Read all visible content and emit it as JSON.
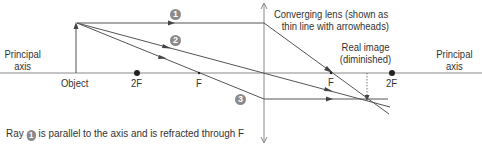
{
  "labels": {
    "principal_axis_left": [
      "Principal",
      "axis"
    ],
    "principal_axis_right": [
      "Principal",
      "axis"
    ],
    "object": "Object",
    "left_2f": "2F",
    "left_f": "F",
    "right_f": "F",
    "right_2f": "2F",
    "lens": [
      "Converging lens (shown as",
      "thin line with arrowheads)"
    ],
    "image": [
      "Real image",
      "(diminished)"
    ]
  },
  "rays": [
    {
      "number": "1",
      "description": "parallel to axis, refracted through F"
    },
    {
      "number": "2",
      "description": "through optical centre, undeviated"
    },
    {
      "number": "3",
      "description": "through F, emerges parallel to axis"
    }
  ],
  "caption": {
    "prefix": "Ray",
    "ray_number": "1",
    "suffix": "is parallel to the axis and is refracted through F"
  },
  "colors": {
    "line": "#555555",
    "axis": "#777777",
    "badge": "#8a8a8a",
    "dot": "#222222"
  }
}
